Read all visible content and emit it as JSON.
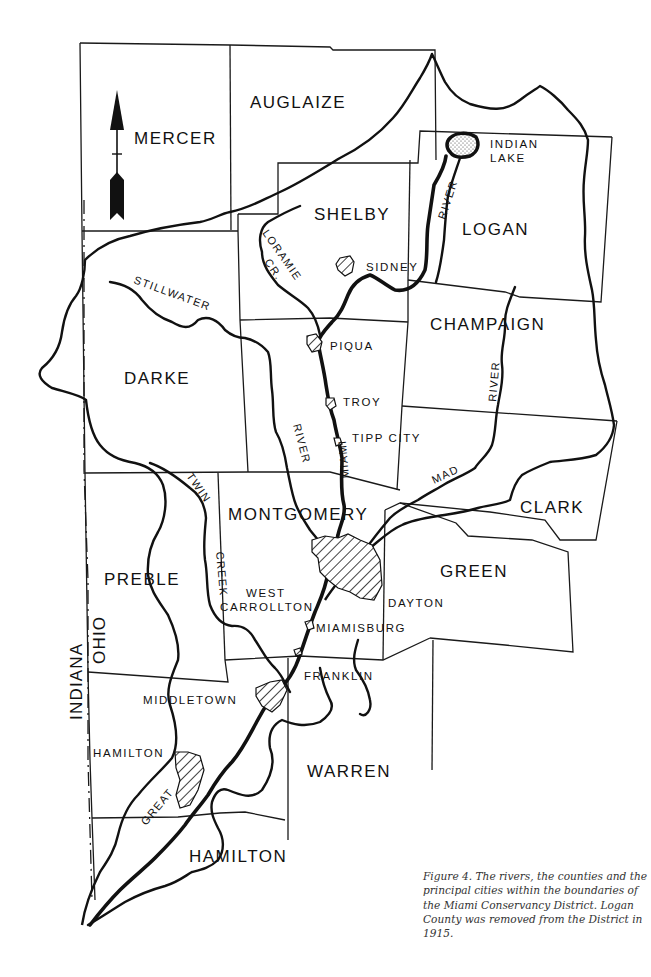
{
  "figure": {
    "caption": "Figure 4. The rivers, the counties and the principal cities within the boundaries of the Miami Conservancy District. Logan County was removed from the District in 1915."
  },
  "north_arrow": {
    "icon": "north-arrow-icon"
  },
  "states": {
    "indiana": "INDIANA",
    "ohio": "OHIO"
  },
  "counties": {
    "mercer": "MERCER",
    "auglaize": "AUGLAIZE",
    "shelby": "SHELBY",
    "logan": "LOGAN",
    "champaign": "CHAMPAIGN",
    "darke": "DARKE",
    "miami_county_hidden": "",
    "montgomery": "MONTGOMERY",
    "clark": "CLARK",
    "green": "GREEN",
    "preble": "PREBLE",
    "warren": "WARREN",
    "butler_hamilton": "HAMILTON"
  },
  "cities": {
    "sidney": "SIDNEY",
    "piqua": "PIQUA",
    "troy": "TROY",
    "tipp_city": "TIPP CITY",
    "dayton": "DAYTON",
    "west_carrollton_1": "WEST",
    "west_carrollton_2": "CARROLLTON",
    "miamisburg": "MIAMISBURG",
    "franklin": "FRANKLIN",
    "middletown": "MIDDLETOWN",
    "hamilton": "HAMILTON"
  },
  "water": {
    "indian_lake_1": "INDIAN",
    "indian_lake_2": "LAKE",
    "stillwater": "STILLWATER",
    "stillwater_river": "RIVER",
    "loramie_1": "LORAMIE",
    "loramie_2": "CR.",
    "miami": "MIAMI",
    "great": "GREAT",
    "great_miami_river_upper": "RIVER",
    "mad": "MAD",
    "mad_river": "RIVER",
    "twin": "TWIN",
    "creek": "CREEK"
  }
}
